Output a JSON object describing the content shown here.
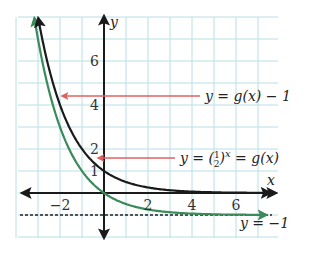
{
  "chart_data": {
    "type": "line",
    "title": "",
    "xlabel": "x",
    "ylabel": "y",
    "xlim": [
      -4,
      8
    ],
    "ylim": [
      -2,
      8
    ],
    "grid": true,
    "x_ticks": [
      {
        "value": -2,
        "label": "−2"
      },
      {
        "value": 2,
        "label": "2"
      },
      {
        "value": 4,
        "label": "4"
      },
      {
        "value": 6,
        "label": "6"
      }
    ],
    "y_ticks": [
      {
        "value": 1,
        "label": "1"
      },
      {
        "value": 2,
        "label": "2"
      },
      {
        "value": 4,
        "label": "4"
      },
      {
        "value": 6,
        "label": "6"
      }
    ],
    "series": [
      {
        "name": "g(x) = (1/2)^x",
        "color": "#1a1a1a",
        "function": "0.5^x",
        "x": [
          -3,
          -2,
          -1,
          0,
          1,
          2,
          3,
          4,
          5,
          6,
          7
        ],
        "values": [
          8,
          4,
          2,
          1,
          0.5,
          0.25,
          0.125,
          0.0625,
          0.03125,
          0.015625,
          0.0078
        ]
      },
      {
        "name": "y = g(x) - 1",
        "color": "#3a8a5a",
        "function": "0.5^x - 1",
        "x": [
          -3,
          -2,
          -1,
          0,
          1,
          2,
          3,
          4,
          5,
          6,
          7
        ],
        "values": [
          7,
          3,
          1,
          0,
          -0.5,
          -0.75,
          -0.875,
          -0.9375,
          -0.96875,
          -0.984,
          -0.992
        ]
      }
    ],
    "asymptote": {
      "y": -1,
      "label": "y = −1",
      "style": "dashed"
    },
    "annotations": [
      {
        "text": "y = g(x) − 1",
        "arrow_to": {
          "x": -2,
          "y": 4.3
        },
        "color": "#e06060"
      },
      {
        "text_parts": [
          "y = (",
          "1",
          "2",
          ")",
          "x",
          " = g(x)"
        ],
        "arrow_to": {
          "x": 0,
          "y": 1.5
        },
        "color": "#e06060"
      }
    ]
  },
  "labels": {
    "x_axis": "x",
    "y_axis": "y",
    "annotation1": "y = g(x) − 1",
    "annotation2_prefix": "y = (",
    "annotation2_num": "1",
    "annotation2_den": "2",
    "annotation2_close": ")",
    "annotation2_exp": "x",
    "annotation2_suffix": " = g(x)",
    "asymptote": "y = −1"
  },
  "colors": {
    "grid": "#b8e0e8",
    "axis": "#1a1a1a",
    "g_curve": "#1a1a1a",
    "shifted_curve": "#3a8a5a",
    "arrow": "#e06060"
  }
}
